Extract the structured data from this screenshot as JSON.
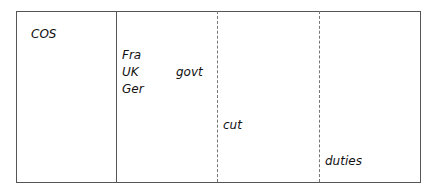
{
  "diagram": {
    "columns": [
      {
        "labels": [
          "COS"
        ]
      },
      {
        "labels": [
          "Fra",
          "UK",
          "Ger",
          "govt"
        ]
      },
      {
        "labels": [
          "cut"
        ]
      },
      {
        "labels": [
          "duties"
        ]
      }
    ],
    "dividers": [
      "solid",
      "dashed",
      "dashed"
    ]
  }
}
